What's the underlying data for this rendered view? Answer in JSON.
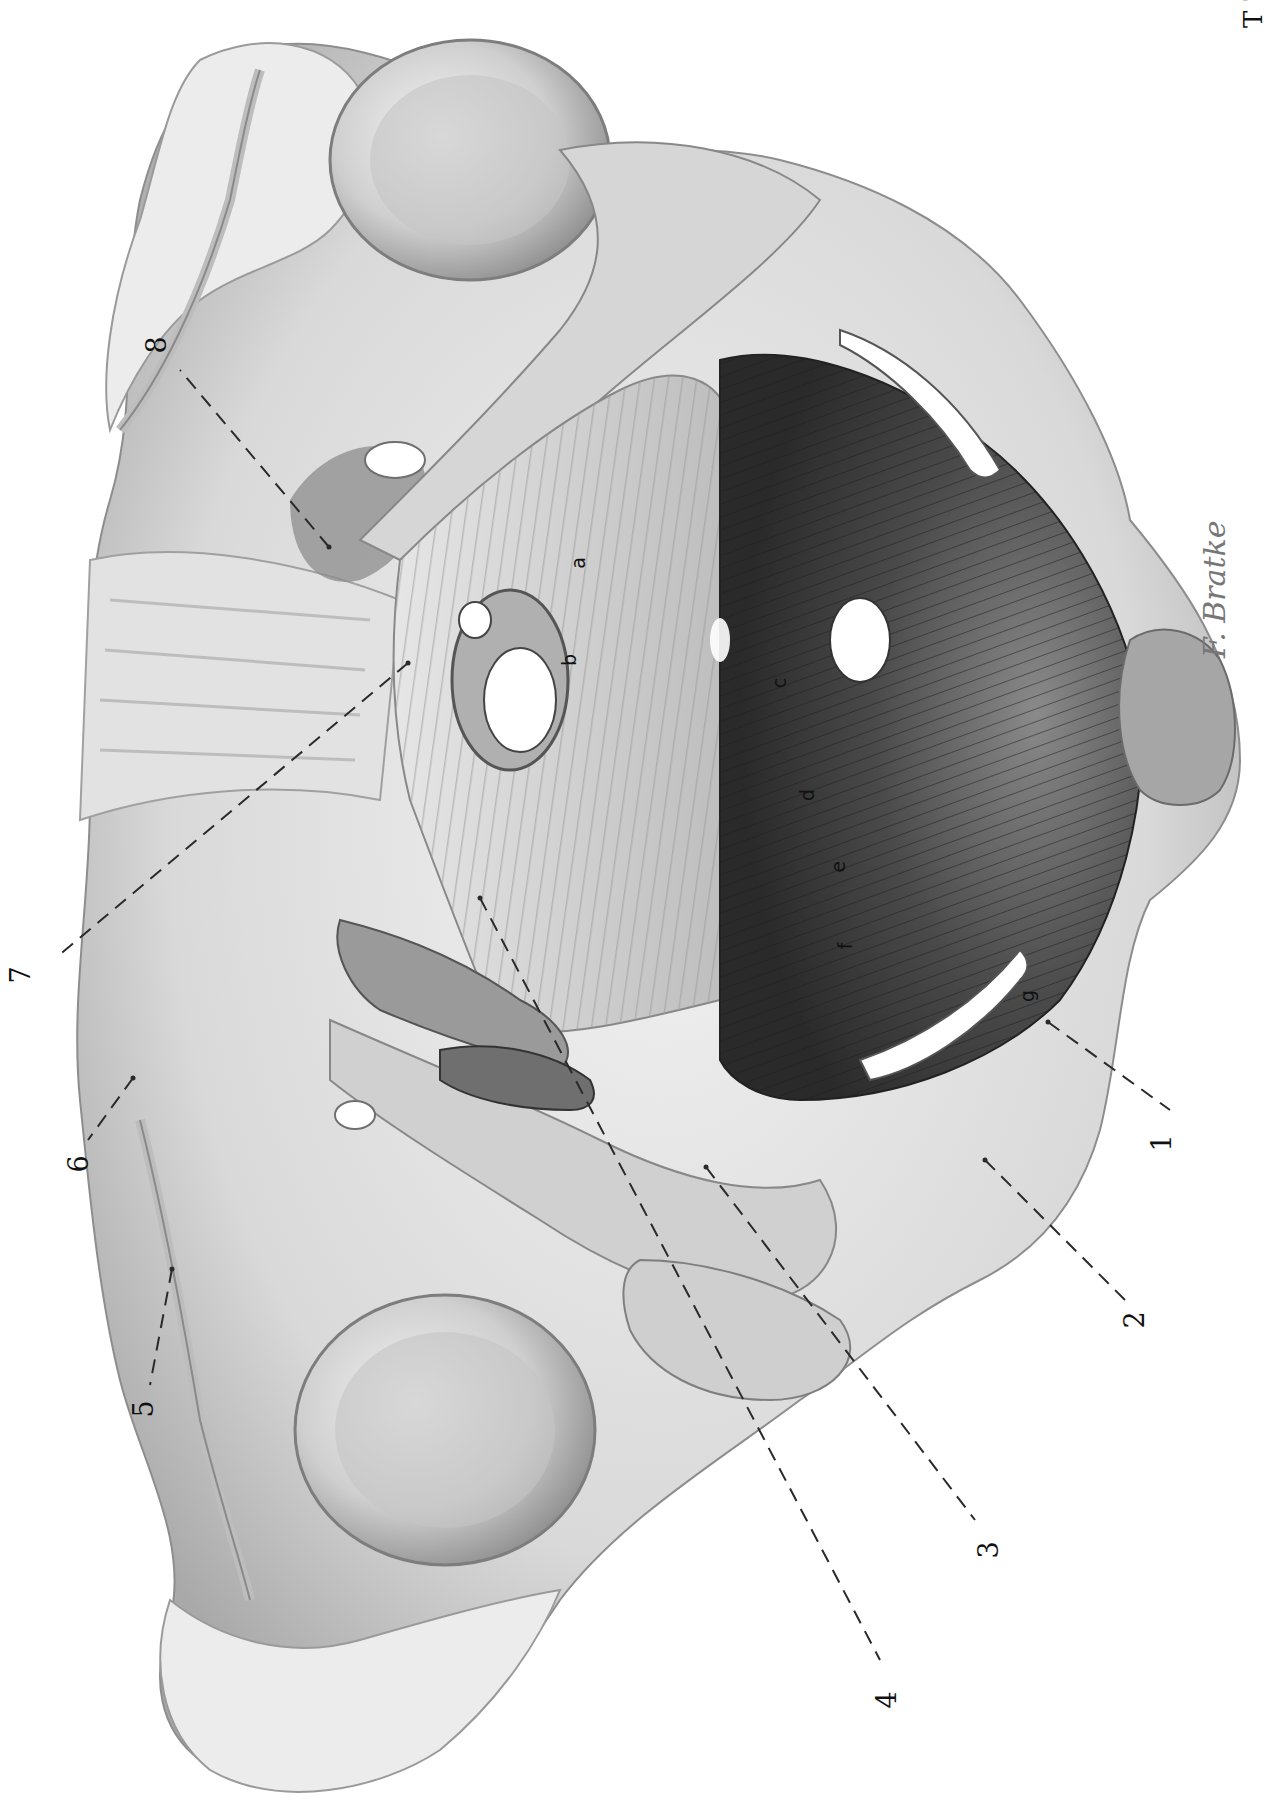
{
  "page": {
    "marker": "T 7"
  },
  "signature": "F. Bratke",
  "colors": {
    "bone_light": "#e9e9e9",
    "bone_mid": "#cfcfcf",
    "bone_shadow": "#a8a8a8",
    "ligament": "#bdbdbd",
    "muscle_light": "#9b9b9b",
    "muscle_dark": "#3d3d3d",
    "membrane": "#d8d8d8",
    "line": "#2a2a2a",
    "background": "#ffffff"
  },
  "callouts": [
    {
      "id": "1",
      "label": "1",
      "label_x": 1163,
      "label_y": 1143,
      "line": [
        [
          1048,
          1022
        ],
        [
          1170,
          1110
        ]
      ]
    },
    {
      "id": "2",
      "label": "2",
      "label_x": 1136,
      "label_y": 1320,
      "line": [
        [
          985,
          1160
        ],
        [
          1125,
          1300
        ]
      ]
    },
    {
      "id": "3",
      "label": "3",
      "label_x": 990,
      "label_y": 1550,
      "line": [
        [
          706,
          1167
        ],
        [
          975,
          1520
        ]
      ]
    },
    {
      "id": "4",
      "label": "4",
      "label_x": 888,
      "label_y": 1700,
      "line": [
        [
          480,
          898
        ],
        [
          880,
          1660
        ]
      ]
    },
    {
      "id": "5",
      "label": "5",
      "label_x": 145,
      "label_y": 1409,
      "line": [
        [
          172,
          1269
        ],
        [
          150,
          1385
        ]
      ]
    },
    {
      "id": "6",
      "label": "6",
      "label_x": 80,
      "label_y": 1164,
      "line": [
        [
          133,
          1078
        ],
        [
          88,
          1140
        ]
      ]
    },
    {
      "id": "7",
      "label": "7",
      "label_x": 22,
      "label_y": 975,
      "line": [
        [
          408,
          663
        ],
        [
          57,
          957
        ]
      ]
    },
    {
      "id": "8",
      "label": "8",
      "label_x": 158,
      "label_y": 345,
      "line": [
        [
          329,
          547
        ],
        [
          180,
          370
        ]
      ]
    }
  ],
  "letters": [
    {
      "id": "a",
      "label": "a",
      "x": 579,
      "y": 563
    },
    {
      "id": "b",
      "label": "b",
      "x": 570,
      "y": 660
    },
    {
      "id": "c",
      "label": "c",
      "x": 780,
      "y": 683
    },
    {
      "id": "d",
      "label": "d",
      "x": 808,
      "y": 795
    },
    {
      "id": "e",
      "label": "e",
      "x": 839,
      "y": 867
    },
    {
      "id": "f",
      "label": "f",
      "x": 846,
      "y": 946
    },
    {
      "id": "g",
      "label": "g",
      "x": 1028,
      "y": 996
    }
  ]
}
